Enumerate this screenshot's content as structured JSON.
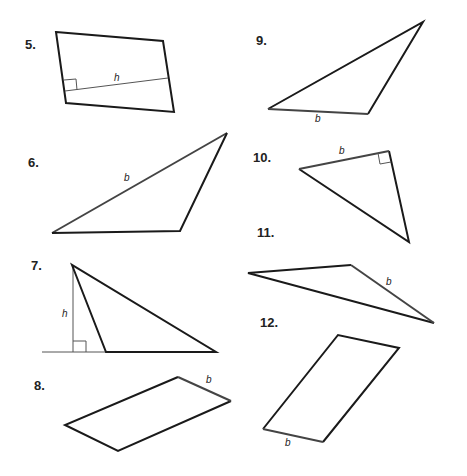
{
  "problems": [
    {
      "number": "5.",
      "shape": "parallelogram",
      "labels": [
        "h"
      ]
    },
    {
      "number": "6.",
      "shape": "triangle",
      "labels": [
        "b"
      ]
    },
    {
      "number": "7.",
      "shape": "triangle",
      "labels": [
        "h"
      ]
    },
    {
      "number": "8.",
      "shape": "parallelogram",
      "labels": [
        "b"
      ]
    },
    {
      "number": "9.",
      "shape": "triangle",
      "labels": [
        "b"
      ]
    },
    {
      "number": "10.",
      "shape": "right-triangle",
      "labels": [
        "b"
      ]
    },
    {
      "number": "11.",
      "shape": "triangle",
      "labels": [
        "b"
      ]
    },
    {
      "number": "12.",
      "shape": "parallelogram",
      "labels": [
        "b"
      ]
    }
  ]
}
